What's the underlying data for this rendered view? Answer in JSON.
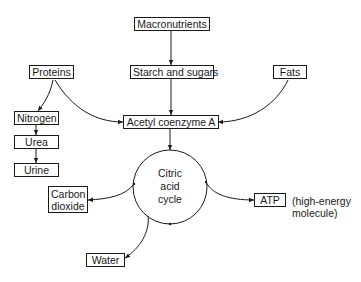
{
  "diagram": {
    "type": "flowchart",
    "title": "",
    "nodes": {
      "macronutrients": "Macronutrients",
      "starch_sugars": "Starch and sugars",
      "proteins": "Proteins",
      "fats": "Fats",
      "acetyl_coa": "Acetyl coenzyme A",
      "nitrogen": "Nitrogen",
      "urea": "Urea",
      "urine": "Urine",
      "cycle_line1": "Citric",
      "cycle_line2": "acid",
      "cycle_line3": "cycle",
      "carbon_dioxide_line1": "Carbon",
      "carbon_dioxide_line2": "dioxide",
      "atp": "ATP",
      "water": "Water"
    },
    "annotations": {
      "atp_note_line1": "(high-energy",
      "atp_note_line2": "molecule)"
    },
    "edges": [
      {
        "from": "Macronutrients",
        "to": "Starch and sugars"
      },
      {
        "from": "Starch and sugars",
        "to": "Acetyl coenzyme A"
      },
      {
        "from": "Proteins",
        "to": "Acetyl coenzyme A"
      },
      {
        "from": "Proteins",
        "to": "Nitrogen"
      },
      {
        "from": "Fats",
        "to": "Acetyl coenzyme A"
      },
      {
        "from": "Nitrogen",
        "to": "Urea"
      },
      {
        "from": "Urea",
        "to": "Urine"
      },
      {
        "from": "Acetyl coenzyme A",
        "to": "Citric acid cycle"
      },
      {
        "from": "Citric acid cycle",
        "to": "Carbon dioxide"
      },
      {
        "from": "Citric acid cycle",
        "to": "ATP"
      },
      {
        "from": "Citric acid cycle",
        "to": "Water"
      }
    ],
    "colors": {
      "line": "#1a1a1a",
      "background": "#ffffff"
    }
  }
}
